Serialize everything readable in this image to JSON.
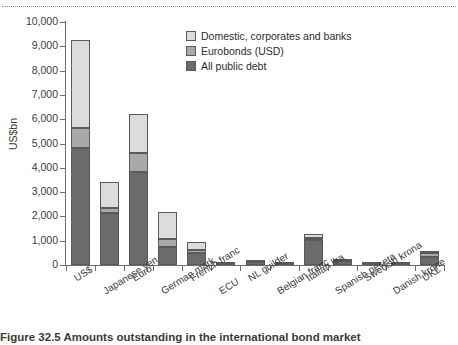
{
  "figure": {
    "caption": "Figure 32.5 Amounts outstanding in the international bond market",
    "top_rule": "dotted-rule"
  },
  "chart_data": {
    "type": "bar",
    "subtype": "stacked-bar",
    "title": "",
    "xlabel": "",
    "ylabel": "US$bn",
    "ylim": [
      0,
      10000
    ],
    "ytick_labels": [
      "10,000",
      "9,000",
      "8,000",
      "7,000",
      "6,000",
      "5,000",
      "4,000",
      "3,000",
      "2,000",
      "1,000",
      "0"
    ],
    "ytick_values": [
      10000,
      9000,
      8000,
      7000,
      6000,
      5000,
      4000,
      3000,
      2000,
      1000,
      0
    ],
    "grid": false,
    "legend_position": "upper-center",
    "categories": [
      "US$",
      "Japanese yen",
      "Euro",
      "German mark",
      "French franc",
      "ECU",
      "NL guilder",
      "Belgian franc",
      "Italian lira",
      "Spanish peseta",
      "Swedish krona",
      "Danish krone",
      "UK£"
    ],
    "series": [
      {
        "name": "All public debt",
        "color": "#6b6b6b",
        "values": [
          4800,
          2150,
          3830,
          730,
          500,
          40,
          110,
          30,
          1020,
          160,
          30,
          20,
          330
        ]
      },
      {
        "name": "Eurobonds (USD)",
        "color": "#a9a9a9",
        "values": [
          850,
          200,
          770,
          330,
          100,
          10,
          30,
          10,
          110,
          20,
          10,
          10,
          160
        ]
      },
      {
        "name": "Domestic, corporates and banks",
        "color": "#dcdcdc",
        "values": [
          3600,
          1050,
          1600,
          1120,
          350,
          10,
          20,
          10,
          160,
          20,
          10,
          10,
          100
        ]
      }
    ],
    "totals": [
      9250,
      3400,
      6200,
      2180,
      950,
      60,
      160,
      50,
      1290,
      200,
      50,
      40,
      590
    ]
  },
  "legend": {
    "entries": [
      {
        "label": "Domestic, corporates and banks",
        "color": "#dcdcdc"
      },
      {
        "label": "Eurobonds (USD)",
        "color": "#a9a9a9"
      },
      {
        "label": "All public debt",
        "color": "#6b6b6b"
      }
    ]
  }
}
